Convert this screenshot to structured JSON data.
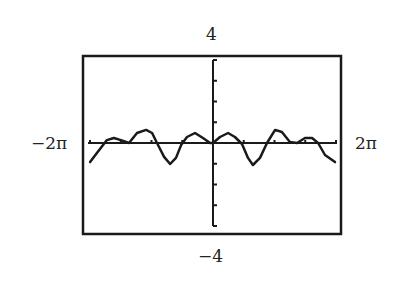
{
  "labels": {
    "ymax": "4",
    "ymin": "−4",
    "xmin": "−2π",
    "xmax": "2π"
  },
  "colors": {
    "ink": "#1a1a1a",
    "background": "#ffffff"
  },
  "chart_data": {
    "type": "line",
    "title": "",
    "xlabel": "",
    "ylabel": "",
    "xlim": [
      -6.2832,
      6.2832
    ],
    "ylim": [
      -4,
      4
    ],
    "x_tick_spacing": "π/2",
    "y_tick_spacing": 1,
    "grid": false,
    "legend": null,
    "series": [
      {
        "name": "f(x)",
        "x": [
          -6.28,
          -5.93,
          -5.42,
          -5.06,
          -4.7,
          -4.29,
          -3.88,
          -3.42,
          -3.11,
          -2.86,
          -2.5,
          -2.19,
          -1.89,
          -1.63,
          -1.33,
          -0.92,
          -0.51,
          -0.15,
          0.0,
          0.36,
          0.77,
          1.12,
          1.48,
          1.79,
          2.04,
          2.4,
          2.76,
          3.17,
          3.52,
          3.93,
          4.29,
          4.7,
          5.06,
          5.37,
          5.72,
          6.23
        ],
        "y": [
          -0.92,
          -0.48,
          0.14,
          0.24,
          0.14,
          0.0,
          0.48,
          0.63,
          0.48,
          0.0,
          -0.67,
          -1.01,
          -0.72,
          -0.1,
          0.29,
          0.48,
          0.24,
          0.0,
          0.0,
          0.29,
          0.48,
          0.29,
          -0.05,
          -0.72,
          -1.06,
          -0.72,
          0.0,
          0.63,
          0.53,
          0.05,
          0.0,
          0.24,
          0.24,
          0.0,
          -0.58,
          -0.92
        ]
      }
    ]
  }
}
